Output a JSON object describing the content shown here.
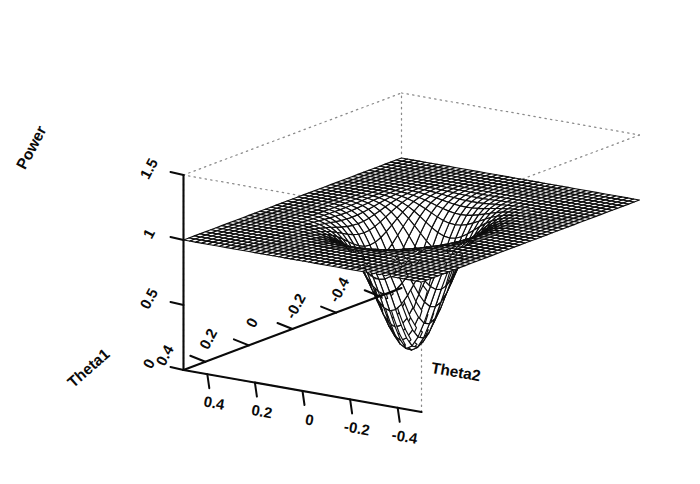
{
  "figure": {
    "kind": "3d-surface-wireframe",
    "background_color": "#ffffff",
    "line_color": "#0d0d0d",
    "box_color": "#8a8a8a",
    "width": 700,
    "height": 484
  },
  "chart_data": {
    "type": "surface",
    "title": "",
    "xlabel": "Theta1",
    "ylabel": "Theta2",
    "zlabel": "Power",
    "grid": false,
    "legend": "none",
    "projection": {
      "theta_deg": -35,
      "phi_deg": 22,
      "note": "R persp-style oblique projection; Theta1 axis runs front-left, Theta2 axis runs front-right, Power is vertical"
    },
    "axes": {
      "x": {
        "name": "Theta1",
        "ticks": [
          0.4,
          0.2,
          0,
          -0.2,
          -0.4
        ],
        "tick_labels": [
          "0.4",
          "0.2",
          "0",
          "-0.2",
          "-0.4"
        ],
        "lim": [
          -0.5,
          0.5
        ],
        "direction": "decreasing-toward-viewer"
      },
      "y": {
        "name": "Theta2",
        "ticks": [
          0.4,
          0.2,
          0,
          -0.2,
          -0.4
        ],
        "tick_labels": [
          "0.4",
          "0.2",
          "0",
          "-0.2",
          "-0.4"
        ],
        "lim": [
          -0.5,
          0.5
        ],
        "direction": "decreasing-to-the-right"
      },
      "z": {
        "name": "Power",
        "ticks": [
          0,
          0.5,
          1,
          1.5
        ],
        "tick_labels": [
          "0",
          "0.5",
          "1",
          "1.5"
        ],
        "lim": [
          0,
          1.5
        ]
      }
    },
    "surface": {
      "description": "Power surface over (Theta1, Theta2): flat plateau at Power = 1 far from the origin, with a smooth circular bowl-shaped depression centered at (0, 0) where Power falls to approximately 0.",
      "nx": 41,
      "ny": 41,
      "plateau_value": 1.0,
      "minimum_value": 0.0,
      "minimum_at": [
        0,
        0
      ],
      "well_radius": 0.23,
      "model": "plateau_minus_gaussian_well",
      "formula": "z = 1 - exp(-(theta1^2 + theta2^2) / (2 * s^2)), s = 0.105",
      "sigma": 0.105,
      "z_range": [
        0.0,
        1.0
      ]
    }
  }
}
